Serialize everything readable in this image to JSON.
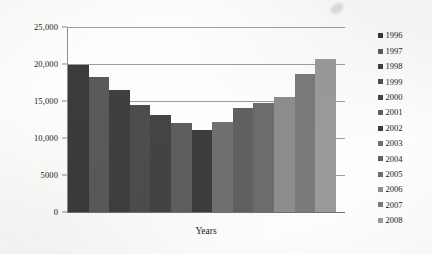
{
  "chart_data": {
    "type": "bar",
    "title": "",
    "subtitle": "",
    "xlabel": "Years",
    "ylabel": "",
    "categories": [
      "1996",
      "1997",
      "1998",
      "1999",
      "2000",
      "2001",
      "2002",
      "2003",
      "2004",
      "2005",
      "2006",
      "2007",
      "2008"
    ],
    "values": [
      19800,
      18300,
      16500,
      14400,
      13100,
      12000,
      11100,
      12200,
      14000,
      14700,
      15600,
      18700,
      20700
    ],
    "series": [
      {
        "name": "",
        "values": [
          19800,
          18300,
          16500,
          14400,
          13100,
          12000,
          11100,
          12200,
          14000,
          14700,
          15600,
          18700,
          20700
        ]
      }
    ],
    "ylim": [
      0,
      25000
    ],
    "yticks": [
      0,
      5000,
      10000,
      15000,
      20000,
      25000
    ],
    "ytick_labels": [
      "0",
      "5000",
      "10,000",
      "15,000",
      "20,000",
      "25,000"
    ],
    "xtick_labels": [],
    "grid": true,
    "grid_axis": "y",
    "legend_position": "right",
    "bar_colors": [
      "#3b3b3b",
      "#5a5a5a",
      "#3f3f3f",
      "#4d4d4d",
      "#444444",
      "#5e5e5e",
      "#3d3d3d",
      "#707070",
      "#606060",
      "#6c6c6c",
      "#8d8d8d",
      "#7a7a7a",
      "#9a9a9a"
    ]
  },
  "legend": {
    "items": [
      {
        "label": "1996",
        "color": "#3b3b3b"
      },
      {
        "label": "1997",
        "color": "#5a5a5a"
      },
      {
        "label": "1998",
        "color": "#3f3f3f"
      },
      {
        "label": "1999",
        "color": "#4d4d4d"
      },
      {
        "label": "2000",
        "color": "#444444"
      },
      {
        "label": "2001",
        "color": "#5e5e5e"
      },
      {
        "label": "2002",
        "color": "#3d3d3d"
      },
      {
        "label": "2003",
        "color": "#707070"
      },
      {
        "label": "2004",
        "color": "#606060"
      },
      {
        "label": "2005",
        "color": "#6c6c6c"
      },
      {
        "label": "2006",
        "color": "#8d8d8d"
      },
      {
        "label": "2007",
        "color": "#7a7a7a"
      },
      {
        "label": "2008",
        "color": "#9a9a9a"
      }
    ]
  }
}
